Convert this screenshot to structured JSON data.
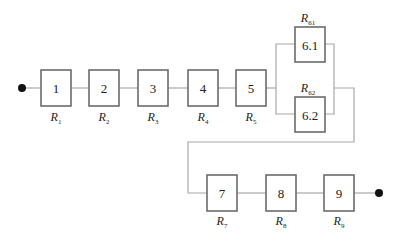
{
  "diagram": {
    "type": "reliability-block-diagram",
    "start_node": {
      "x": 22,
      "y": 88
    },
    "end_node": {
      "x": 379,
      "y": 193
    },
    "blocks": [
      {
        "id": "1",
        "label": "1",
        "r_base": "R",
        "r_sub": "1",
        "x": 41,
        "y": 70
      },
      {
        "id": "2",
        "label": "2",
        "r_base": "R",
        "r_sub": "2",
        "x": 89,
        "y": 70
      },
      {
        "id": "3",
        "label": "3",
        "r_base": "R",
        "r_sub": "3",
        "x": 138,
        "y": 70
      },
      {
        "id": "4",
        "label": "4",
        "r_base": "R",
        "r_sub": "4",
        "x": 188,
        "y": 70
      },
      {
        "id": "5",
        "label": "5",
        "r_base": "R",
        "r_sub": "5",
        "x": 236,
        "y": 70
      },
      {
        "id": "6.1",
        "label": "6.1",
        "r_base": "R",
        "r_sub": "61",
        "x": 295,
        "y": 27,
        "label_above": true
      },
      {
        "id": "6.2",
        "label": "6.2",
        "r_base": "R",
        "r_sub": "62",
        "x": 295,
        "y": 97,
        "label_above": true
      },
      {
        "id": "7",
        "label": "7",
        "r_base": "R",
        "r_sub": "7",
        "x": 207,
        "y": 175
      },
      {
        "id": "8",
        "label": "8",
        "r_base": "R",
        "r_sub": "8",
        "x": 266,
        "y": 175
      },
      {
        "id": "9",
        "label": "9",
        "r_base": "R",
        "r_sub": "9",
        "x": 324,
        "y": 175
      }
    ],
    "connections": [
      "start-1",
      "1-2",
      "2-3",
      "3-4",
      "4-5",
      "5-(6.1 || 6.2)",
      "(6.1 || 6.2)-7",
      "7-8",
      "8-9",
      "9-end"
    ]
  }
}
